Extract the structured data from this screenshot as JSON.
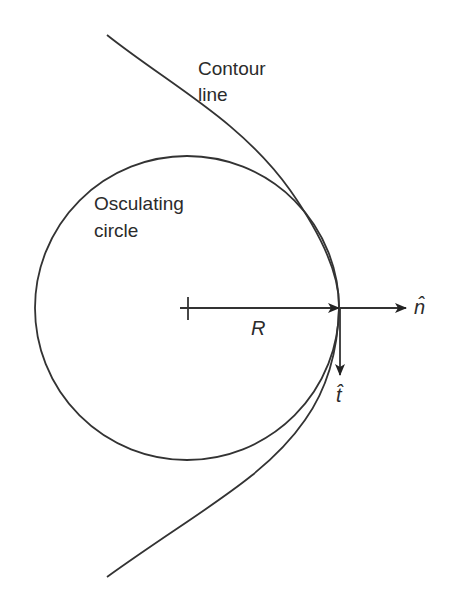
{
  "diagram": {
    "labels": {
      "contour_line_1": "Contour",
      "contour_line_2": "line",
      "osculating_1": "Osculating",
      "osculating_2": "circle",
      "radius": "R",
      "normal": "n̂",
      "tangent": "t̂"
    },
    "colors": {
      "stroke": "#333333",
      "background": "#ffffff"
    },
    "geometry": {
      "circle_center": [
        187,
        308
      ],
      "circle_radius": 152,
      "contact_point": [
        339,
        308
      ]
    }
  }
}
